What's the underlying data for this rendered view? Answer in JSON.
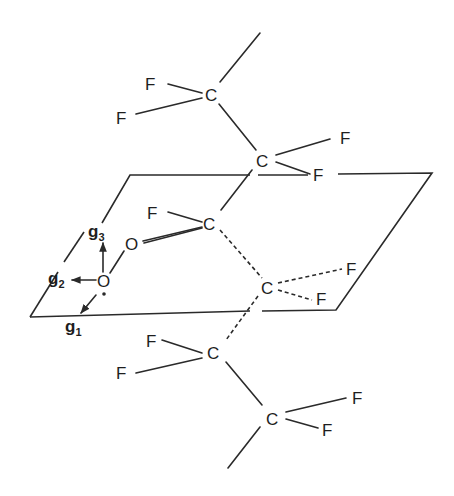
{
  "diagram": {
    "atoms": {
      "c1": "C",
      "c2": "C",
      "c3": "C",
      "c4": "C",
      "c5": "C",
      "c6": "C",
      "f1a": "F",
      "f1b": "F",
      "f2a": "F",
      "f2b": "F",
      "f3a": "F",
      "f4a": "F",
      "f4b": "F",
      "f5a": "F",
      "f5b": "F",
      "f6a": "F",
      "f6b": "F",
      "o1": "O",
      "o2": "O"
    },
    "g_axes": {
      "g1": {
        "base": "g",
        "sub": "1"
      },
      "g2": {
        "base": "g",
        "sub": "2"
      },
      "g3": {
        "base": "g",
        "sub": "3"
      }
    },
    "colors": {
      "ink": "#2a2a2a",
      "background": "#ffffff"
    }
  }
}
